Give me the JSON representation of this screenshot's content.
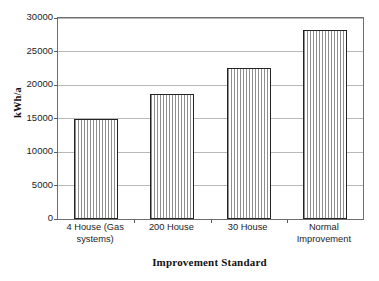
{
  "chart_data": {
    "type": "bar",
    "title": "",
    "subtitle": "",
    "xlabel": "Improvement Standard",
    "ylabel": "kWh/a",
    "categories": [
      "4 House (Gas systems)",
      "200 House",
      "30 House",
      "Normal Improvement"
    ],
    "category_lines": [
      [
        "4 House (Gas",
        "systems)"
      ],
      [
        "200 House"
      ],
      [
        "30 House"
      ],
      [
        "Normal",
        "Improvement"
      ]
    ],
    "values": [
      15000,
      18700,
      22600,
      28200
    ],
    "ylim": [
      0,
      30000
    ],
    "ytick_values": [
      0,
      5000,
      10000,
      15000,
      20000,
      25000,
      30000
    ],
    "ytick_labels": [
      "0",
      "5000",
      "10000",
      "15000",
      "20000",
      "25000",
      "30000"
    ],
    "grid": true,
    "grid_axis": "y",
    "legend": false,
    "legend_position": "none",
    "bar_fill": "vertical-line-hatch",
    "bar_edge_color": "#232323",
    "bar_hatch_color": "#8f8f8f",
    "plot_border_color": "#6e6e6e",
    "gridline_color": "#b9b9b9",
    "background_color": "#ffffff"
  }
}
